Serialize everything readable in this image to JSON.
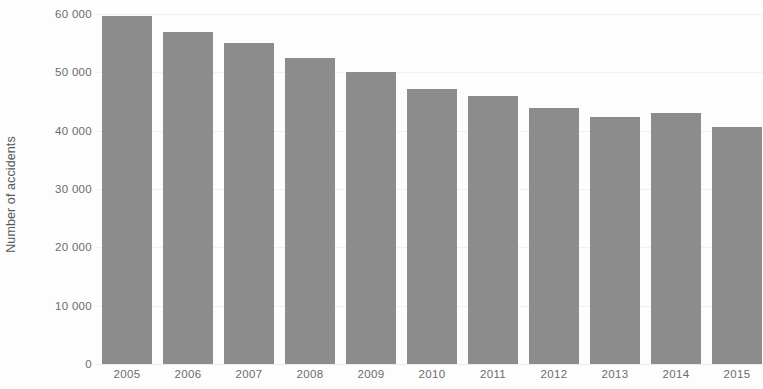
{
  "chart_data": {
    "type": "bar",
    "title": "",
    "subtitle": "",
    "xlabel": "",
    "ylabel": "Number of accidents",
    "categories": [
      "2005",
      "2006",
      "2007",
      "2008",
      "2009",
      "2010",
      "2011",
      "2012",
      "2013",
      "2014",
      "2015"
    ],
    "values": [
      59700,
      57000,
      55000,
      52500,
      50100,
      47200,
      46000,
      43900,
      42400,
      43000,
      40600
    ],
    "ylim": [
      0,
      60000
    ],
    "ytick_values": [
      60000,
      50000,
      40000,
      30000,
      20000,
      10000,
      0
    ],
    "ytick_labels": [
      "60 000",
      "50 000",
      "40 000",
      "30 000",
      "20 000",
      "10 000",
      "0"
    ],
    "grid": true,
    "grid_axis": "y",
    "legend": false,
    "legend_position": "none",
    "bar_color": "#8c8c8c",
    "background_color": "#fdfdfd",
    "axis_text_color": "#6a6c6e",
    "gridline_color": "#f0f0f0",
    "note": "Rightmost bar (2015) is clipped by the image edge."
  }
}
